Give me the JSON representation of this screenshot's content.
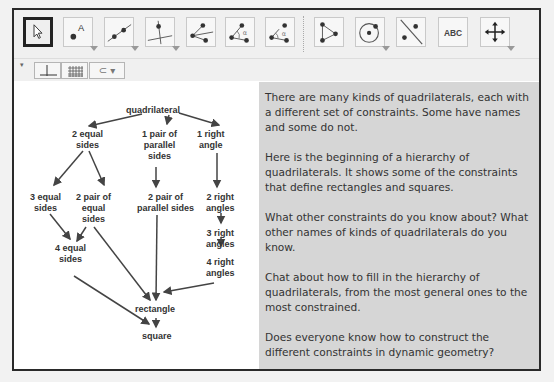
{
  "toolbar": {
    "tools": [
      {
        "name": "move-tool",
        "icon": "cursor-arrow-icon",
        "selected": true
      },
      {
        "name": "point-tool",
        "icon": "point-label-icon",
        "has_menu": true
      },
      {
        "name": "line-tool",
        "icon": "line-through-points-icon",
        "has_menu": true
      },
      {
        "name": "perpendicular-line-tool",
        "icon": "perpendicular-line-icon",
        "has_menu": true
      },
      {
        "name": "rays-tool",
        "icon": "rays-icon"
      },
      {
        "name": "angle-tool",
        "icon": "angle-icon"
      },
      {
        "name": "angle-given-size-tool",
        "icon": "angle-given-size-icon"
      },
      {
        "name": "polygon-tool",
        "icon": "polygon-icon"
      },
      {
        "name": "circle-tool",
        "icon": "circle-center-point-icon",
        "has_menu": true
      },
      {
        "name": "reflect-tool",
        "icon": "reflect-about-line-icon"
      },
      {
        "name": "text-tool",
        "icon": "text-icon",
        "label": "ABC"
      },
      {
        "name": "move-graphics-tool",
        "icon": "move-graphics-view-icon",
        "has_menu": true
      }
    ]
  },
  "style_bar": {
    "axes_toggle": "axes-icon",
    "grid_toggle": "grid-icon",
    "subset_menu": "⊂ ▾"
  },
  "hierarchy": {
    "nodes": {
      "quadrilateral": "quadrilateral",
      "two_equal_sides": "2 equal\nsides",
      "one_pair_parallel": "1 pair of\nparallel\nsides",
      "one_right_angle": "1 right\nangle",
      "three_equal_sides": "3 equal\nsides",
      "two_pair_equal": "2 pair of\nequal\nsides",
      "two_pair_parallel": "2 pair of\nparallel sides",
      "two_right_angles": "2 right\nangles",
      "three_right_angles": "3 right\nangles",
      "four_right_angles": "4 right\nangles",
      "four_equal_sides": "4 equal\nsides",
      "rectangle": "rectangle",
      "square": "square"
    }
  },
  "text_panel": {
    "paragraphs": [
      "There are many kinds of quadrilaterals, each with a different set of constraints. Some have names and some do not.",
      "Here is the beginning of a hierarchy of quadrilaterals. It shows some of the constraints that define rectangles and squares.",
      "What other constraints do you know about? What other names of kinds of quadrilaterals do you know.",
      "Chat about how to fill in the hierarchy of quadrilaterals, from the most general ones to the most constrained.",
      "Does everyone know how to construct the different constraints in dynamic geometry?"
    ]
  }
}
